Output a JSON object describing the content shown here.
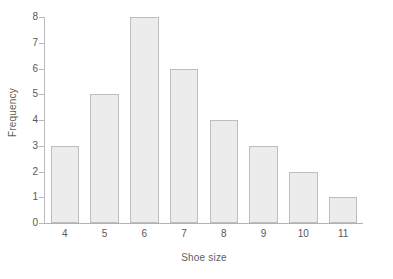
{
  "chart_data": {
    "type": "bar",
    "title": "",
    "subtitle": "",
    "xlabel": "Shoe size",
    "ylabel": "Frequency",
    "categories": [
      "4",
      "5",
      "6",
      "7",
      "8",
      "9",
      "10",
      "11"
    ],
    "values": [
      3,
      5,
      8,
      6,
      4,
      3,
      2,
      1
    ],
    "series": [
      {
        "name": "Frequency",
        "values": [
          3,
          5,
          8,
          6,
          4,
          3,
          2,
          1
        ]
      }
    ],
    "xlim": [
      3.5,
      11.5
    ],
    "ylim": [
      0,
      8
    ],
    "yticks": [
      0,
      1,
      2,
      3,
      4,
      5,
      6,
      7,
      8
    ],
    "ytick_labels": [
      "0",
      "1",
      "2",
      "3",
      "4",
      "5",
      "6",
      "7",
      "8"
    ],
    "xtick_labels": [
      "4",
      "5",
      "6",
      "7",
      "8",
      "9",
      "10",
      "11"
    ],
    "grid": false,
    "legend": false,
    "legend_position": "none",
    "bar_fill_color": "#ececec",
    "bar_edge_color": "#bdbdbd",
    "axis_color": "#b9b9b9",
    "text_color": "#58585a",
    "background_color": "#ffffff"
  }
}
